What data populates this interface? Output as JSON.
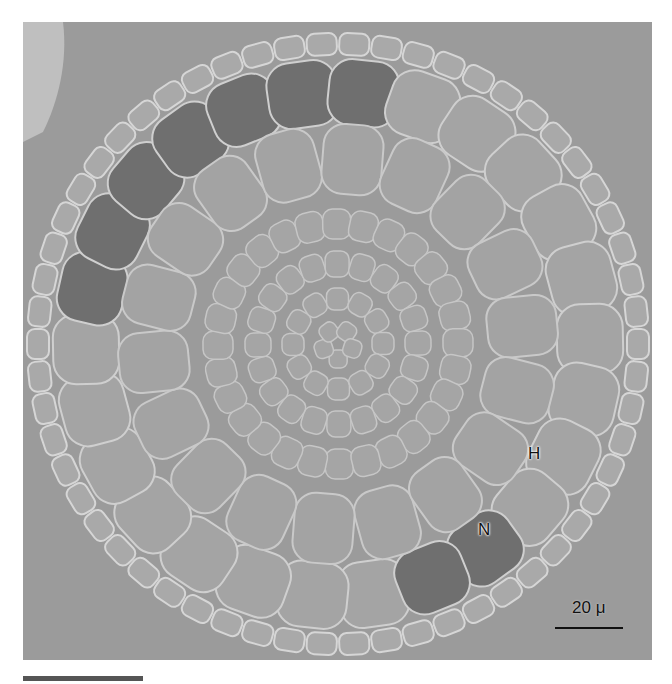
{
  "figure": {
    "labels": [
      {
        "text": "H",
        "x": 528,
        "y": 444
      },
      {
        "text": "N",
        "x": 478,
        "y": 520
      }
    ],
    "scale_bar": {
      "label": "20 μ",
      "length_px": 76
    },
    "colors": {
      "background": "#9a9a9a",
      "cell_light": "#a8a8a8",
      "cell_dark": "#6e6e6e",
      "cell_edge": "#d8d8d8",
      "text": "#111111"
    }
  }
}
